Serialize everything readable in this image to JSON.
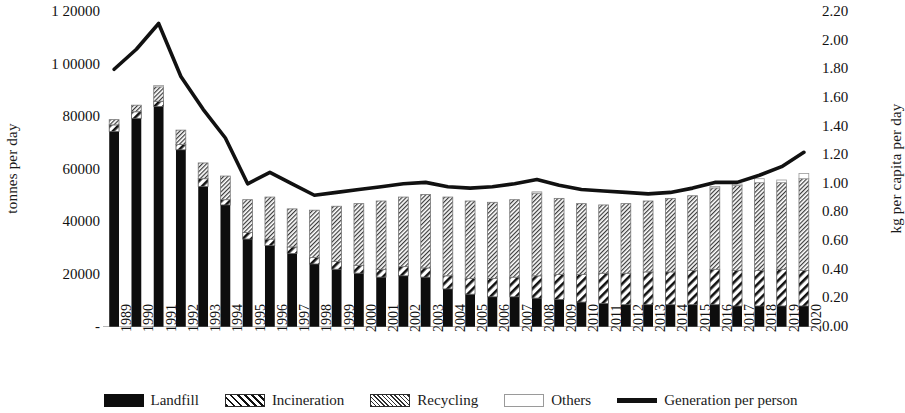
{
  "chart_data": {
    "type": "bar",
    "title": "",
    "subtitle": "",
    "xlabel": "",
    "ylabel": "tonnes per day",
    "y2label": "kg per capita per day",
    "grid": false,
    "legend_position": "bottom",
    "ylim": [
      0,
      120000
    ],
    "y2lim": [
      0.0,
      2.2
    ],
    "ytick_labels": [
      "1 20000",
      "1 00000",
      "80000",
      "60000",
      "40000",
      "20000",
      "-"
    ],
    "ytick_values": [
      120000,
      100000,
      80000,
      60000,
      40000,
      20000,
      0
    ],
    "y2tick_labels": [
      "2.20",
      "2.00",
      "1.80",
      "1.60",
      "1.40",
      "1.20",
      "1.00",
      "0.80",
      "0.60",
      "0.40",
      "0.20",
      "0.00"
    ],
    "y2tick_values": [
      2.2,
      2.0,
      1.8,
      1.6,
      1.4,
      1.2,
      1.0,
      0.8,
      0.6,
      0.4,
      0.2,
      0.0
    ],
    "categories": [
      "1989",
      "1990",
      "1991",
      "1992",
      "1993",
      "1994",
      "1995",
      "1996",
      "1997",
      "1998",
      "1999",
      "2000",
      "2001",
      "2002",
      "2003",
      "2004",
      "2005",
      "2006",
      "2007",
      "2008",
      "2009",
      "2010",
      "2011",
      "2012",
      "2013",
      "2014",
      "2015",
      "2016",
      "2017",
      "2018",
      "2019",
      "2020"
    ],
    "stacked": true,
    "series": [
      {
        "name": "Landfill",
        "axis": "left",
        "style": "solid-black",
        "color": "#0d0d0d",
        "values": [
          74500,
          79500,
          84000,
          67500,
          53500,
          46500,
          33500,
          31000,
          28000,
          24000,
          22000,
          20500,
          19000,
          19500,
          19000,
          14500,
          12500,
          11500,
          11500,
          11000,
          10500,
          9500,
          9000,
          8500,
          8500,
          8500,
          8500,
          8500,
          8000,
          8000,
          8000,
          8000
        ]
      },
      {
        "name": "Incineration",
        "axis": "left",
        "style": "diagonal-hatch",
        "color": "#111111",
        "values": [
          2500,
          2500,
          2000,
          2000,
          3000,
          2000,
          2500,
          2500,
          2500,
          2500,
          3000,
          3000,
          3000,
          3500,
          3500,
          5000,
          6000,
          7000,
          7500,
          8500,
          9500,
          10500,
          11500,
          12000,
          12500,
          12500,
          13000,
          13500,
          13500,
          13500,
          14000,
          13500
        ]
      },
      {
        "name": "Recycling",
        "axis": "left",
        "style": "dense-hatch",
        "color": "#2e2e2e",
        "values": [
          2000,
          2500,
          5500,
          5500,
          6000,
          9000,
          12500,
          16000,
          14500,
          18000,
          21000,
          23500,
          26000,
          26500,
          28000,
          30000,
          29500,
          29000,
          29500,
          31500,
          29000,
          27000,
          26000,
          26500,
          27000,
          28000,
          28500,
          31000,
          32500,
          33500,
          33000,
          35000
        ]
      },
      {
        "name": "Others",
        "axis": "left",
        "style": "white",
        "color": "#ffffff",
        "values": [
          0,
          0,
          500,
          0,
          0,
          0,
          0,
          0,
          0,
          0,
          0,
          0,
          0,
          0,
          0,
          0,
          0,
          0,
          0,
          500,
          0,
          0,
          0,
          0,
          0,
          0,
          0,
          500,
          500,
          1500,
          1000,
          2000
        ]
      },
      {
        "name": "Generation per person",
        "axis": "right",
        "style": "line",
        "color": "#111111",
        "values": [
          1.8,
          1.94,
          2.12,
          1.75,
          1.52,
          1.32,
          1.0,
          1.08,
          1.0,
          0.92,
          0.94,
          0.96,
          0.98,
          1.0,
          1.01,
          0.98,
          0.97,
          0.98,
          1.0,
          1.03,
          0.99,
          0.96,
          0.95,
          0.94,
          0.93,
          0.94,
          0.97,
          1.01,
          1.01,
          1.06,
          1.12,
          1.22
        ]
      }
    ]
  },
  "legend": {
    "items": [
      {
        "label": "Landfill",
        "swatch": "landfill-swatch"
      },
      {
        "label": "Incineration",
        "swatch": "incineration-swatch"
      },
      {
        "label": "Recycling",
        "swatch": "recycling-swatch"
      },
      {
        "label": "Others",
        "swatch": "others-swatch"
      },
      {
        "label": "Generation per person",
        "swatch": "line-swatch"
      }
    ]
  }
}
